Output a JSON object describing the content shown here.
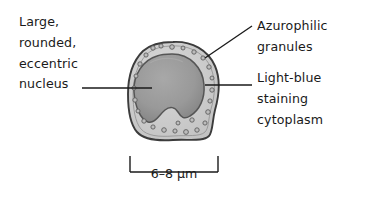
{
  "figure": {
    "background_color": "#ffffff",
    "ink_color": "#1a1a1a"
  },
  "labels": {
    "nucleus": {
      "text": "Large,\nrounded,\neccentric\nnucleus",
      "lines": [
        "Large,",
        "rounded,",
        "eccentric",
        "nucleus"
      ],
      "side": "left"
    },
    "granules": {
      "text": "Azurophilic\ngranules",
      "lines": [
        "Azurophilic",
        "granules"
      ],
      "side": "right"
    },
    "cytoplasm": {
      "text": "Light-blue\nstaining\ncytoplasm",
      "lines": [
        "Light-blue",
        "staining",
        "cytoplasm"
      ],
      "side": "right"
    }
  },
  "scale_bar": {
    "caption": "6–8 µm",
    "value_min": 6,
    "value_max": 8,
    "unit": "µm"
  },
  "cell": {
    "membrane_color": "#4a4a4a",
    "cytoplasm_color": "#cfcfcf",
    "nucleus_color": "#9a9a9a",
    "nucleus_edge_color": "#5a5a5a",
    "granule_color": "#b9b9b9",
    "granule_edge_color": "#5e5e5e",
    "granule_count": 26
  }
}
